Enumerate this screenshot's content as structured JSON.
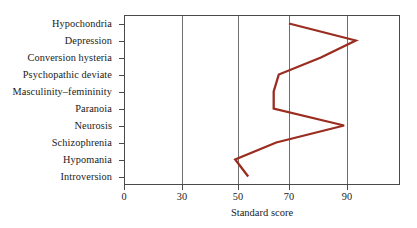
{
  "chart_data": {
    "type": "line",
    "title": "",
    "xlabel": "Standard score",
    "ylabel": "",
    "orientation": "horizontal",
    "grid": "vertical-only",
    "legend": "none",
    "xlim": [
      0,
      100
    ],
    "xticks": [
      0,
      30,
      50,
      70,
      90
    ],
    "xtick_labels": [
      "0",
      "30",
      "50",
      "70",
      "90"
    ],
    "categories": [
      "Hypochondria",
      "Depression",
      "Conversion hysteria",
      "Psychopathic deviate",
      "Masculinity–femininity",
      "Paranoia",
      "Neurosis",
      "Schizophrenia",
      "Hypomania",
      "Introversion"
    ],
    "values": [
      70,
      93,
      81,
      66,
      64,
      64,
      89,
      65,
      49,
      54
    ],
    "series": [
      {
        "name": "Standard score profile",
        "color": "#9b2d20",
        "values": [
          70,
          93,
          81,
          66,
          64,
          64,
          89,
          65,
          49,
          54
        ]
      }
    ],
    "points": [
      {
        "category": "Hypochondria",
        "value": 70
      },
      {
        "category": "Depression",
        "value": 93
      },
      {
        "category": "Conversion hysteria",
        "value": 81
      },
      {
        "category": "Psychopathic deviate",
        "value": 66
      },
      {
        "category": "Masculinity–femininity",
        "value": 64
      },
      {
        "category": "Paranoia",
        "value": 64
      },
      {
        "category": "Neurosis",
        "value": 89
      },
      {
        "category": "Schizophrenia",
        "value": 65
      },
      {
        "category": "Hypomania",
        "value": 49
      },
      {
        "category": "Introversion",
        "value": 54
      }
    ]
  },
  "style": {
    "line_color": "#9b2d20",
    "axis_color": "#4a4a4a",
    "grid_color": "#6f6f6f",
    "background": "#ffffff",
    "text_color": "#1a1a1a"
  }
}
